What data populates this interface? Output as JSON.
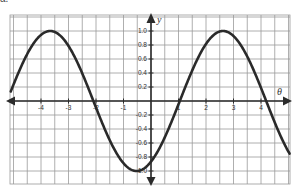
{
  "caption": "a.",
  "chart_data": {
    "type": "line",
    "title": "",
    "xlabel": "θ",
    "ylabel": "y",
    "function": "y = sin(θ − π/3)",
    "amplitude": 1,
    "period": 6.2832,
    "phase_shift": 1.0472,
    "xlim": [
      -5.1,
      5.05
    ],
    "ylim": [
      -1.2,
      1.22
    ],
    "x_ticks": [
      -4,
      -3,
      -2,
      -1,
      1,
      2,
      3,
      4
    ],
    "x_tick_labels": [
      "-4",
      "-3",
      "-2",
      "-1",
      "1",
      "2",
      "3",
      "4"
    ],
    "y_ticks": [
      1.0,
      0.8,
      0.6,
      0.4,
      0.2,
      -0.2,
      -0.4,
      -0.6,
      -0.8,
      -1.0
    ],
    "y_tick_labels": [
      "1.0",
      "0.8",
      "0.6",
      "0.4",
      "0.2",
      "-0.2",
      "-0.4",
      "-0.6",
      "-0.8",
      "-1.0"
    ],
    "grid": true,
    "grid_x_step": 0.5,
    "grid_y_step": 0.2,
    "legend": null,
    "key_points": [
      {
        "x": -3.67,
        "y": 1.0,
        "note": "maximum"
      },
      {
        "x": -2.09,
        "y": 0.0,
        "note": "zero"
      },
      {
        "x": -0.52,
        "y": -1.0,
        "note": "minimum"
      },
      {
        "x": 0.0,
        "y": -0.87,
        "note": "y-intercept"
      },
      {
        "x": 1.05,
        "y": 0.0,
        "note": "zero"
      },
      {
        "x": 2.62,
        "y": 1.0,
        "note": "maximum"
      },
      {
        "x": 4.19,
        "y": 0.0,
        "note": "zero"
      }
    ],
    "series": [
      {
        "name": "y",
        "x": [
          -5.1,
          -4.5,
          -4.0,
          -3.67,
          -3.0,
          -2.5,
          -2.09,
          -1.5,
          -1.0,
          -0.52,
          0.0,
          0.5,
          1.05,
          1.5,
          2.0,
          2.62,
          3.0,
          3.5,
          4.19,
          4.5,
          5.05
        ],
        "values": [
          0.28,
          0.74,
          0.95,
          1.0,
          0.79,
          0.4,
          0.0,
          -0.56,
          -0.87,
          -1.0,
          -0.87,
          -0.52,
          0.0,
          0.43,
          0.82,
          1.0,
          0.93,
          0.77,
          0.0,
          -0.3,
          -0.78
        ]
      }
    ]
  },
  "colors": {
    "curve": "#2a2a2a",
    "axes": "#2b2b2b",
    "grid": "#9a9a9a",
    "background": "#ffffff"
  }
}
